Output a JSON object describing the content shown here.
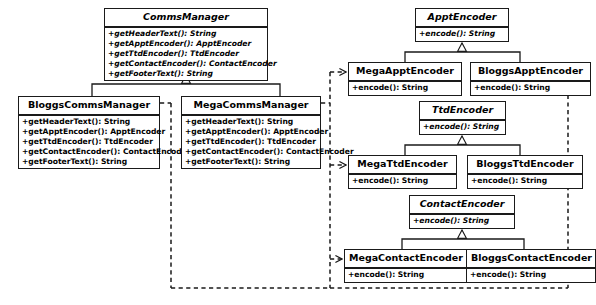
{
  "diagram": {
    "stroke_color": "#1a1a1a",
    "background_color": "#ffffff",
    "classes": [
      {
        "id": "comms-manager",
        "name": "CommsManager",
        "abstract": true,
        "operations": [
          "+getHeaderText(): String",
          "+getApptEncoder(): ApptEncoder",
          "+getTtdEncoder(): TtdEncoder",
          "+getContactEncoder(): ContactEncoder",
          "+getFooterText(): String"
        ]
      },
      {
        "id": "bloggs-comms-manager",
        "name": "BloggsCommsManager",
        "abstract": false,
        "operations": [
          "+getHeaderText(): String",
          "+getApptEncoder(): ApptEncoder",
          "+getTtdEncoder(): TtdEncoder",
          "+getContactEncoder(): ContactEncoder",
          "+getFooterText(): String"
        ]
      },
      {
        "id": "mega-comms-manager",
        "name": "MegaCommsManager",
        "abstract": false,
        "operations": [
          "+getHeaderText(): String",
          "+getApptEncoder(): ApptEncoder",
          "+getTtdEncoder(): TtdEncoder",
          "+getContactEncoder(): ContactEncoder",
          "+getFooterText(): String"
        ]
      },
      {
        "id": "appt-encoder",
        "name": "ApptEncoder",
        "abstract": true,
        "operations": [
          "+encode(): String"
        ]
      },
      {
        "id": "mega-appt-encoder",
        "name": "MegaApptEncoder",
        "abstract": false,
        "operations": [
          "+encode(): String"
        ]
      },
      {
        "id": "bloggs-appt-encoder",
        "name": "BloggsApptEncoder",
        "abstract": false,
        "operations": [
          "+encode(): String"
        ]
      },
      {
        "id": "ttd-encoder",
        "name": "TtdEncoder",
        "abstract": true,
        "operations": [
          "+encode(): String"
        ]
      },
      {
        "id": "mega-ttd-encoder",
        "name": "MegaTtdEncoder",
        "abstract": false,
        "operations": [
          "+encode(): String"
        ]
      },
      {
        "id": "bloggs-ttd-encoder",
        "name": "BloggsTtdEncoder",
        "abstract": false,
        "operations": [
          "+encode(): String"
        ]
      },
      {
        "id": "contact-encoder",
        "name": "ContactEncoder",
        "abstract": true,
        "operations": [
          "+encode(): String"
        ]
      },
      {
        "id": "mega-contact-encoder",
        "name": "MegaContactEncoder",
        "abstract": false,
        "operations": [
          "+encode(): String"
        ]
      },
      {
        "id": "bloggs-contact-encoder",
        "name": "BloggsContactEncoder",
        "abstract": false,
        "operations": [
          "+encode(): String"
        ]
      }
    ],
    "relationships": [
      {
        "type": "generalization",
        "from": "BloggsCommsManager",
        "to": "CommsManager"
      },
      {
        "type": "generalization",
        "from": "MegaCommsManager",
        "to": "CommsManager"
      },
      {
        "type": "generalization",
        "from": "MegaApptEncoder",
        "to": "ApptEncoder"
      },
      {
        "type": "generalization",
        "from": "BloggsApptEncoder",
        "to": "ApptEncoder"
      },
      {
        "type": "generalization",
        "from": "MegaTtdEncoder",
        "to": "TtdEncoder"
      },
      {
        "type": "generalization",
        "from": "BloggsTtdEncoder",
        "to": "TtdEncoder"
      },
      {
        "type": "generalization",
        "from": "MegaContactEncoder",
        "to": "ContactEncoder"
      },
      {
        "type": "generalization",
        "from": "BloggsContactEncoder",
        "to": "ContactEncoder"
      },
      {
        "type": "dependency",
        "from": "MegaCommsManager",
        "to": "MegaApptEncoder"
      },
      {
        "type": "dependency",
        "from": "MegaCommsManager",
        "to": "MegaTtdEncoder"
      },
      {
        "type": "dependency",
        "from": "MegaCommsManager",
        "to": "MegaContactEncoder"
      },
      {
        "type": "dependency",
        "from": "BloggsCommsManager",
        "to": "BloggsApptEncoder"
      },
      {
        "type": "dependency",
        "from": "BloggsCommsManager",
        "to": "BloggsTtdEncoder"
      },
      {
        "type": "dependency",
        "from": "BloggsCommsManager",
        "to": "BloggsContactEncoder"
      }
    ]
  }
}
